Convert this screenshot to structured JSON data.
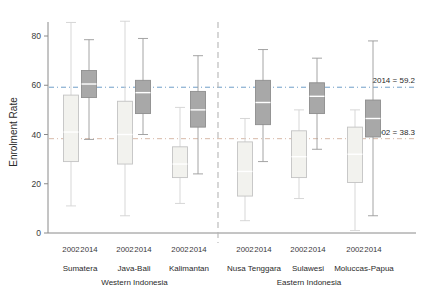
{
  "chart_data": {
    "type": "box",
    "title": "",
    "xlabel": "",
    "ylabel": "Enrolment Rate",
    "ylim": [
      0,
      88
    ],
    "yticks": [
      0,
      20,
      40,
      60,
      80
    ],
    "ytick_labels": [
      "0",
      "20",
      "40",
      "60",
      "80"
    ],
    "grid": false,
    "legend": "none",
    "series_names": [
      "2002",
      "2014"
    ],
    "series_colors": {
      "2002": "#f2f2ee",
      "2014": "#a8a8a8"
    },
    "group_labels": [
      "Western Indonesia",
      "Eastern Indonesia"
    ],
    "categories": [
      "Sumatera",
      "Java-Bali",
      "Kalimantan",
      "Nusa Tenggara",
      "Sulawesi",
      "Moluccas-Papua"
    ],
    "reference_lines": [
      {
        "label": "2014 = 59.2",
        "value": 59.2,
        "color": "#6f9fc8",
        "style": "dashdot"
      },
      {
        "label": "2002 = 38.3",
        "value": 38.3,
        "color": "#d8b9a8",
        "style": "dashdot"
      }
    ],
    "boxes": [
      {
        "category": "Sumatera",
        "region": "Western Indonesia",
        "year": "2002",
        "whisker_low": 11.0,
        "q1": 29.0,
        "median": 41.0,
        "q3": 56.0,
        "whisker_high": 85.5
      },
      {
        "category": "Sumatera",
        "region": "Western Indonesia",
        "year": "2014",
        "whisker_low": 38.0,
        "q1": 55.0,
        "median": 60.5,
        "q3": 66.0,
        "whisker_high": 78.5
      },
      {
        "category": "Java-Bali",
        "region": "Western Indonesia",
        "year": "2002",
        "whisker_low": 7.0,
        "q1": 28.0,
        "median": 40.0,
        "q3": 53.5,
        "whisker_high": 86.0
      },
      {
        "category": "Java-Bali",
        "region": "Western Indonesia",
        "year": "2014",
        "whisker_low": 40.0,
        "q1": 48.5,
        "median": 57.0,
        "q3": 62.0,
        "whisker_high": 79.0
      },
      {
        "category": "Kalimantan",
        "region": "Western Indonesia",
        "year": "2002",
        "whisker_low": 12.0,
        "q1": 22.5,
        "median": 28.0,
        "q3": 35.0,
        "whisker_high": 51.0
      },
      {
        "category": "Kalimantan",
        "region": "Western Indonesia",
        "year": "2014",
        "whisker_low": 24.0,
        "q1": 43.0,
        "median": 50.0,
        "q3": 57.5,
        "whisker_high": 72.0
      },
      {
        "category": "Nusa Tenggara",
        "region": "Eastern Indonesia",
        "year": "2002",
        "whisker_low": 5.0,
        "q1": 15.0,
        "median": 25.0,
        "q3": 37.0,
        "whisker_high": 46.5
      },
      {
        "category": "Nusa Tenggara",
        "region": "Eastern Indonesia",
        "year": "2014",
        "whisker_low": 29.0,
        "q1": 44.0,
        "median": 53.0,
        "q3": 62.0,
        "whisker_high": 74.5
      },
      {
        "category": "Sulawesi",
        "region": "Eastern Indonesia",
        "year": "2002",
        "whisker_low": 14.0,
        "q1": 22.5,
        "median": 31.0,
        "q3": 41.5,
        "whisker_high": 50.0
      },
      {
        "category": "Sulawesi",
        "region": "Eastern Indonesia",
        "year": "2014",
        "whisker_low": 34.0,
        "q1": 48.5,
        "median": 55.5,
        "q3": 61.0,
        "whisker_high": 71.0
      },
      {
        "category": "Moluccas-Papua",
        "region": "Eastern Indonesia",
        "year": "2002",
        "whisker_low": 1.0,
        "q1": 20.5,
        "median": 32.0,
        "q3": 43.0,
        "whisker_high": 50.0
      },
      {
        "category": "Moluccas-Papua",
        "region": "Eastern Indonesia",
        "year": "2014",
        "whisker_low": 7.0,
        "q1": 39.0,
        "median": 46.5,
        "q3": 54.0,
        "whisker_high": 78.0
      }
    ]
  }
}
